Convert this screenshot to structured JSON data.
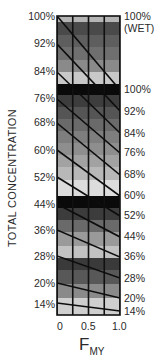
{
  "chart_data": {
    "type": "heatmap",
    "title": "",
    "xlabel": "F",
    "xlabel_subscript": "MY",
    "ylabel": "TOTAL CONCENTRATION",
    "x_ticks": [
      "0",
      "0.5",
      "1.0"
    ],
    "x_range": [
      0,
      1.0
    ],
    "x_gridlines": [
      0,
      0.25,
      0.5,
      0.75,
      1.0
    ],
    "left_axis_ticks": [
      "100%",
      "92%",
      "84%",
      "76%",
      "68%",
      "60%",
      "52%",
      "44%",
      "36%",
      "28%",
      "20%",
      "14%"
    ],
    "right_axis_ticks": [
      "100%",
      "(WET)",
      "100%",
      "92%",
      "84%",
      "76%",
      "68%",
      "60%",
      "52%",
      "44%",
      "36%",
      "28%",
      "20%",
      "14%"
    ],
    "bands": [
      {
        "y0": 16,
        "y1": 22,
        "color": "#b5b5b5"
      },
      {
        "y0": 22,
        "y1": 35,
        "color": "#4a4a4a"
      },
      {
        "y0": 35,
        "y1": 47,
        "color": "#5e5e5e"
      },
      {
        "y0": 47,
        "y1": 60,
        "color": "#6f6f6f"
      },
      {
        "y0": 60,
        "y1": 72,
        "color": "#8a8a8a"
      },
      {
        "y0": 72,
        "y1": 84,
        "color": "#c8c8c8"
      },
      {
        "y0": 84,
        "y1": 95,
        "color": "#0a0a0a"
      },
      {
        "y0": 95,
        "y1": 107,
        "color": "#3d3d3d"
      },
      {
        "y0": 107,
        "y1": 119,
        "color": "#555555"
      },
      {
        "y0": 119,
        "y1": 131,
        "color": "#6a6a6a"
      },
      {
        "y0": 131,
        "y1": 143,
        "color": "#7e7e7e"
      },
      {
        "y0": 143,
        "y1": 155,
        "color": "#8e8e8e"
      },
      {
        "y0": 155,
        "y1": 167,
        "color": "#a2a2a2"
      },
      {
        "y0": 167,
        "y1": 180,
        "color": "#b8b8b8"
      },
      {
        "y0": 180,
        "y1": 196,
        "color": "#dcdcdc"
      },
      {
        "y0": 196,
        "y1": 208,
        "color": "#0a0a0a"
      },
      {
        "y0": 208,
        "y1": 220,
        "color": "#3c3c3c"
      },
      {
        "y0": 220,
        "y1": 232,
        "color": "#6a6a6a"
      },
      {
        "y0": 232,
        "y1": 246,
        "color": "#9a9a9a"
      },
      {
        "y0": 246,
        "y1": 258,
        "color": "#c2c2c2"
      },
      {
        "y0": 258,
        "y1": 270,
        "color": "#3a3a3a"
      },
      {
        "y0": 270,
        "y1": 284,
        "color": "#585858"
      },
      {
        "y0": 284,
        "y1": 298,
        "color": "#8a8a8a"
      },
      {
        "y0": 298,
        "y1": 315,
        "color": "#cfcfcf"
      }
    ],
    "diagonal_lines": [
      {
        "x1": 57,
        "y1": 16,
        "x2": 120,
        "y2": 90
      },
      {
        "x1": 57,
        "y1": 44,
        "x2": 120,
        "y2": 111
      },
      {
        "x1": 57,
        "y1": 72,
        "x2": 120,
        "y2": 133
      },
      {
        "x1": 57,
        "y1": 99,
        "x2": 120,
        "y2": 153
      },
      {
        "x1": 57,
        "y1": 123,
        "x2": 120,
        "y2": 175
      },
      {
        "x1": 57,
        "y1": 150,
        "x2": 120,
        "y2": 196
      },
      {
        "x1": 57,
        "y1": 177,
        "x2": 120,
        "y2": 216
      },
      {
        "x1": 57,
        "y1": 204,
        "x2": 120,
        "y2": 237
      },
      {
        "x1": 57,
        "y1": 230,
        "x2": 120,
        "y2": 257
      },
      {
        "x1": 57,
        "y1": 256,
        "x2": 120,
        "y2": 278
      },
      {
        "x1": 57,
        "y1": 283,
        "x2": 120,
        "y2": 298
      },
      {
        "x1": 57,
        "y1": 303,
        "x2": 120,
        "y2": 311
      }
    ]
  },
  "labels": {
    "left": [
      {
        "text": "100%",
        "y": 11
      },
      {
        "text": "92%",
        "y": 38
      },
      {
        "text": "84%",
        "y": 66
      },
      {
        "text": "76%",
        "y": 93
      },
      {
        "text": "68%",
        "y": 117
      },
      {
        "text": "60%",
        "y": 145
      },
      {
        "text": "52%",
        "y": 172
      },
      {
        "text": "44%",
        "y": 199
      },
      {
        "text": "36%",
        "y": 225
      },
      {
        "text": "28%",
        "y": 251
      },
      {
        "text": "20%",
        "y": 278
      },
      {
        "text": "14%",
        "y": 299
      }
    ],
    "right": [
      {
        "text": "100%",
        "y": 11
      },
      {
        "text": "(WET)",
        "y": 23
      },
      {
        "text": "100%",
        "y": 84
      },
      {
        "text": "92%",
        "y": 106
      },
      {
        "text": "84%",
        "y": 128
      },
      {
        "text": "76%",
        "y": 147
      },
      {
        "text": "68%",
        "y": 169
      },
      {
        "text": "60%",
        "y": 190
      },
      {
        "text": "52%",
        "y": 210
      },
      {
        "text": "44%",
        "y": 231
      },
      {
        "text": "36%",
        "y": 251
      },
      {
        "text": "28%",
        "y": 273
      },
      {
        "text": "20%",
        "y": 293
      },
      {
        "text": "14%",
        "y": 306
      }
    ],
    "ylabel": "TOTAL CONCENTRATION",
    "xticks": [
      {
        "text": "0",
        "x": 57
      },
      {
        "text": "0.5",
        "x": 81
      },
      {
        "text": "1.0",
        "x": 112
      }
    ],
    "xtitle_main": "F",
    "xtitle_sub": "MY"
  }
}
